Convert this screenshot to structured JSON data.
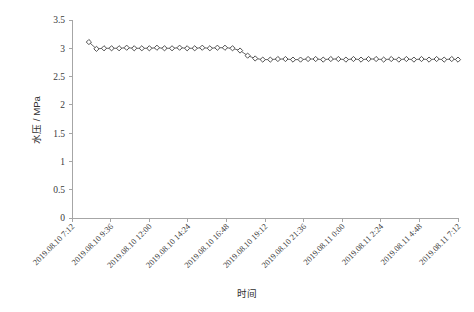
{
  "chart_data": {
    "type": "line",
    "title": "",
    "xlabel": "时间",
    "ylabel": "水压 / MPa",
    "ylim": [
      0,
      3.5
    ],
    "ytick_labels": [
      "0",
      "0.5",
      "1",
      "1.5",
      "2",
      "2.5",
      "3",
      "3.5"
    ],
    "ytick_values": [
      0,
      0.5,
      1,
      1.5,
      2,
      2.5,
      3,
      3.5
    ],
    "xtick_labels": [
      "2019.08.10 7:12",
      "2019.08.10 9:36",
      "2019.08.10 12:00",
      "2019.08.10 14:24",
      "2019.08.10 16:48",
      "2019.08.10 19:12",
      "2019.08.10 21:36",
      "2019.08.11 0:00",
      "2019.08.11 2:24",
      "2019.08.11 4:48",
      "2019.08.11 7:12"
    ],
    "xtick_values": [
      0,
      2.4,
      4.8,
      7.2,
      9.6,
      12,
      14.4,
      16.8,
      19.2,
      21.6,
      24
    ],
    "xlim": [
      0,
      24
    ],
    "grid": false,
    "legend": "none",
    "marker": "diamond-open",
    "series": [
      {
        "name": "水压",
        "x": [
          1.05,
          1.52,
          1.99,
          2.46,
          2.93,
          3.4,
          3.87,
          4.34,
          4.81,
          5.28,
          5.75,
          6.22,
          6.69,
          7.16,
          7.63,
          8.1,
          8.57,
          9.04,
          9.51,
          9.98,
          10.45,
          10.92,
          11.39,
          11.86,
          12.33,
          12.8,
          13.27,
          13.74,
          14.21,
          14.68,
          15.15,
          15.62,
          16.09,
          16.56,
          17.03,
          17.5,
          17.97,
          18.44,
          18.91,
          19.38,
          19.85,
          20.32,
          20.79,
          21.26,
          21.73,
          22.2,
          22.67,
          23.14,
          23.61,
          24.0
        ],
        "values": [
          3.11,
          2.99,
          3.0,
          3.0,
          3.0,
          3.01,
          3.0,
          3.0,
          3.0,
          3.01,
          3.0,
          3.0,
          3.01,
          3.0,
          3.0,
          3.01,
          3.0,
          3.01,
          3.01,
          3.0,
          2.96,
          2.87,
          2.82,
          2.8,
          2.8,
          2.81,
          2.81,
          2.8,
          2.8,
          2.81,
          2.81,
          2.8,
          2.81,
          2.81,
          2.8,
          2.81,
          2.8,
          2.81,
          2.81,
          2.8,
          2.81,
          2.8,
          2.81,
          2.8,
          2.81,
          2.8,
          2.81,
          2.8,
          2.81,
          2.8
        ]
      }
    ]
  },
  "figure": {
    "caption": ""
  }
}
